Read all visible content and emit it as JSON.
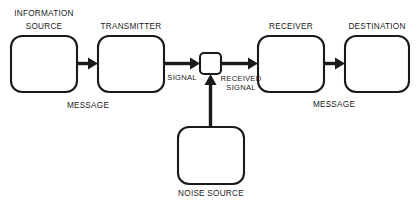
{
  "diagram": {
    "background_color": "#ffffff",
    "stroke_color": "#1a1a1a",
    "nodes": [
      {
        "id": "information-source",
        "label_line1": "INFORMATION",
        "label_line2": "SOURCE",
        "x": 11,
        "y": 36,
        "w": 66,
        "h": 56
      },
      {
        "id": "transmitter",
        "label_line1": "TRANSMITTER",
        "label_line2": "",
        "x": 98,
        "y": 36,
        "w": 66,
        "h": 56
      },
      {
        "id": "receiver",
        "label_line1": "RECEIVER",
        "label_line2": "",
        "x": 258,
        "y": 36,
        "w": 66,
        "h": 56
      },
      {
        "id": "destination",
        "label_line1": "DESTINATION",
        "label_line2": "",
        "x": 345,
        "y": 36,
        "w": 64,
        "h": 56
      },
      {
        "id": "noise-source",
        "label_line1": "NOISE SOURCE",
        "label_line2": "",
        "x": 178,
        "y": 127,
        "w": 66,
        "h": 57
      }
    ],
    "junction": {
      "id": "signal-junction",
      "x": 200,
      "y": 53,
      "w": 21,
      "h": 21
    },
    "edge_labels": [
      {
        "id": "message-left",
        "text": "MESSAGE",
        "x": 88,
        "y": 108
      },
      {
        "id": "signal",
        "text": "SIGNAL",
        "x": 182,
        "y": 80
      },
      {
        "id": "received-signal-line1",
        "text": "RECEIVED",
        "x": 241,
        "y": 81
      },
      {
        "id": "received-signal-line2",
        "text": "SIGNAL",
        "x": 241,
        "y": 90
      },
      {
        "id": "message-right",
        "text": "MESSAGE",
        "x": 334,
        "y": 107
      }
    ]
  }
}
